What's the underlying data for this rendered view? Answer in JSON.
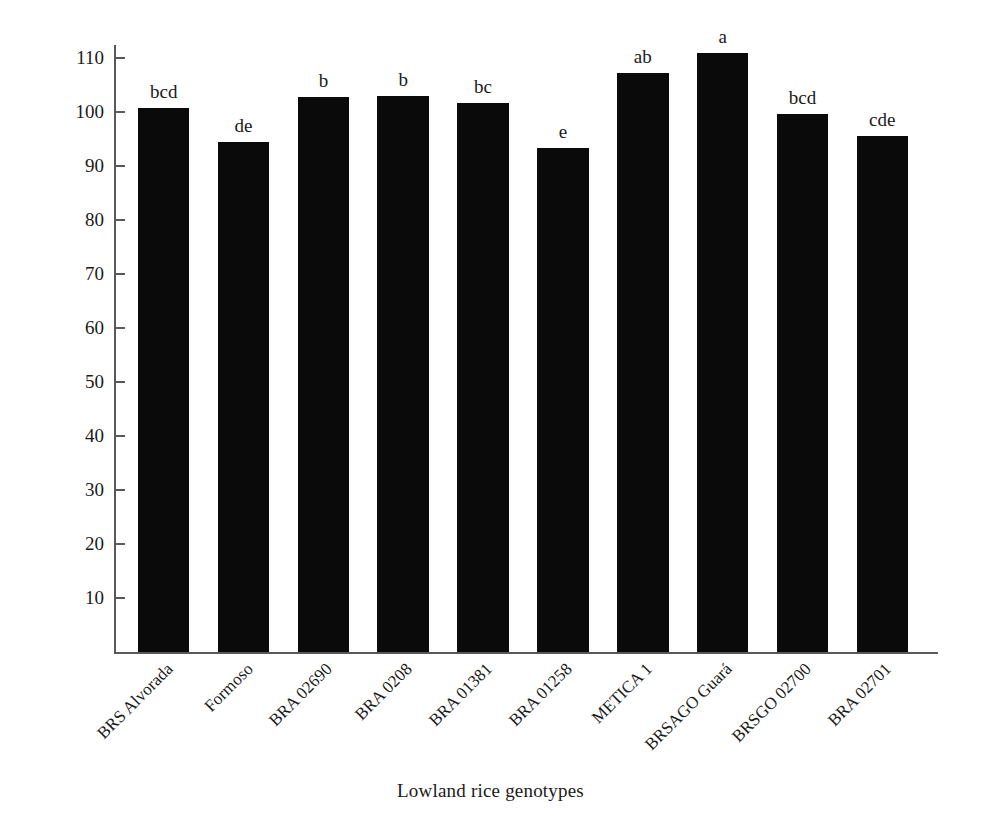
{
  "chart_data": {
    "type": "bar",
    "title": "",
    "xlabel": "Lowland rice genotypes",
    "ylabel": "Plant height (cm)",
    "categories": [
      "BRS Alvorada",
      "Formoso",
      "BRA 02690",
      "BRA 0208",
      "BRA 01381",
      "BRA 01258",
      "METICA 1",
      "BRSAGO Guará",
      "BRSGO 02700",
      "BRA 02701"
    ],
    "values": [
      100.8,
      94.6,
      102.8,
      103.1,
      101.7,
      93.4,
      107.3,
      111.1,
      99.8,
      95.6
    ],
    "annotations": [
      "bcd",
      "de",
      "b",
      "b",
      "bc",
      "e",
      "ab",
      "a",
      "bcd",
      "cde"
    ],
    "ylim": [
      0,
      112.5
    ],
    "yticks": [
      10,
      20,
      30,
      40,
      50,
      60,
      70,
      80,
      90,
      100,
      110
    ],
    "ytick_labels": [
      "10",
      "20",
      "30",
      "40",
      "50",
      "60",
      "70",
      "80",
      "90",
      "100",
      "110"
    ],
    "grid": false,
    "legend": "none",
    "bar_color": "#0a0a0a",
    "axis_color": "#595959"
  }
}
